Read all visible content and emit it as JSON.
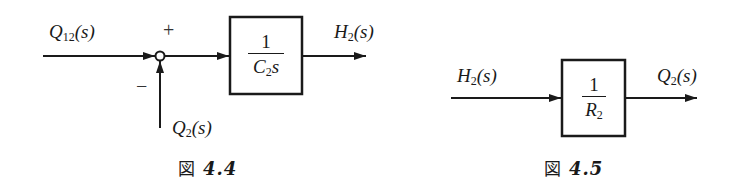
{
  "figures": [
    {
      "caption": {
        "prefix": "図",
        "number": "4.4"
      },
      "input": {
        "symbol": "Q",
        "sub": "12",
        "arg": "(s)"
      },
      "feedback": {
        "symbol": "Q",
        "sub": "2",
        "arg": "(s)"
      },
      "output": {
        "symbol": "H",
        "sub": "2",
        "arg": "(s)"
      },
      "summing_junction": {
        "plus_sign": "+",
        "minus_sign": "−"
      },
      "block": {
        "numerator": "1",
        "denominator_symbol": "C",
        "denominator_sub": "2",
        "denominator_tail": "s"
      }
    },
    {
      "caption": {
        "prefix": "図",
        "number": "4.5"
      },
      "input": {
        "symbol": "H",
        "sub": "2",
        "arg": "(s)"
      },
      "output": {
        "symbol": "Q",
        "sub": "2",
        "arg": "(s)"
      },
      "block": {
        "numerator": "1",
        "denominator_symbol": "R",
        "denominator_sub": "2",
        "denominator_tail": ""
      }
    }
  ],
  "colors": {
    "ink": "#1a1a1a",
    "background": "#ffffff"
  }
}
